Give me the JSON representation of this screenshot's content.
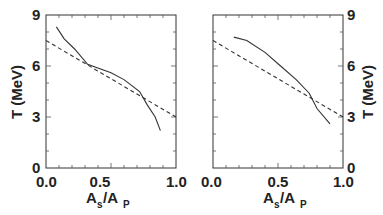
{
  "chart_data": [
    {
      "type": "line",
      "panel": "left",
      "xlabel": "As/Ap",
      "ylabel": "T (MeV)",
      "xlim": [
        0.0,
        1.0
      ],
      "ylim": [
        0,
        9
      ],
      "xticks": [
        "0.0",
        "0.5",
        "1.0"
      ],
      "yticks": [
        "0",
        "3",
        "6",
        "9"
      ],
      "y_axis_side": "left",
      "series": [
        {
          "name": "solid",
          "style": "solid",
          "x": [
            0.08,
            0.14,
            0.22,
            0.32,
            0.5,
            0.6,
            0.72,
            0.78,
            0.84,
            0.88
          ],
          "y": [
            8.3,
            7.6,
            7.0,
            6.1,
            5.6,
            5.2,
            4.5,
            3.7,
            3.0,
            2.2
          ]
        },
        {
          "name": "dashed",
          "style": "dashed",
          "x": [
            0.0,
            1.0
          ],
          "y": [
            7.5,
            3.0
          ]
        }
      ]
    },
    {
      "type": "line",
      "panel": "right",
      "xlabel": "As/Ap",
      "ylabel": "T (MeV)",
      "xlim": [
        0.0,
        1.0
      ],
      "ylim": [
        0,
        9
      ],
      "xticks": [
        "0.0",
        "0.5",
        "1.0"
      ],
      "yticks": [
        "0",
        "3",
        "6",
        "9"
      ],
      "y_axis_side": "right",
      "series": [
        {
          "name": "solid",
          "style": "solid",
          "x": [
            0.16,
            0.26,
            0.4,
            0.52,
            0.64,
            0.74,
            0.8,
            0.9
          ],
          "y": [
            7.7,
            7.5,
            6.8,
            6.0,
            5.2,
            4.4,
            3.5,
            2.6
          ]
        },
        {
          "name": "dashed",
          "style": "dashed",
          "x": [
            0.0,
            1.0
          ],
          "y": [
            7.5,
            3.0
          ]
        }
      ]
    }
  ],
  "labels": {
    "y_axis": "T (MeV)",
    "x_axis_main_A": "A",
    "x_axis_sub_s": "s",
    "x_axis_slash": "/A",
    "x_axis_sub_p": "P",
    "xtick_0": "0.0",
    "xtick_05": "0.5",
    "xtick_1": "1.0",
    "ytick_0": "0",
    "ytick_3": "3",
    "ytick_6": "6",
    "ytick_9": "9"
  }
}
